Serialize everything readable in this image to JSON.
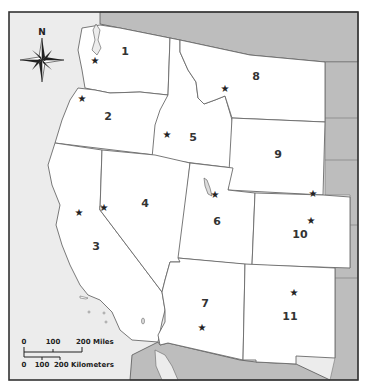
{
  "map": {
    "title": "",
    "colors": {
      "land": "#ffffff",
      "ocean": "#ececec",
      "outside_region": "#bdbdbd",
      "border": "#444444",
      "state_line": "#6a6a6a"
    },
    "compass": {
      "label": "N"
    },
    "states": [
      {
        "id": 1,
        "label": "1",
        "label_pos": [
          125,
          55
        ],
        "capital_star": [
          95,
          60
        ]
      },
      {
        "id": 2,
        "label": "2",
        "label_pos": [
          108,
          120
        ],
        "capital_star": [
          82,
          98
        ]
      },
      {
        "id": 3,
        "label": "3",
        "label_pos": [
          96,
          250
        ],
        "capital_star": [
          79,
          212
        ]
      },
      {
        "id": 4,
        "label": "4",
        "label_pos": [
          145,
          207
        ],
        "capital_star": [
          104,
          207
        ]
      },
      {
        "id": 5,
        "label": "5",
        "label_pos": [
          193,
          141
        ],
        "capital_star": [
          167,
          134
        ]
      },
      {
        "id": 6,
        "label": "6",
        "label_pos": [
          217,
          225
        ],
        "capital_star": [
          215,
          194
        ]
      },
      {
        "id": 7,
        "label": "7",
        "label_pos": [
          205,
          307
        ],
        "capital_star": [
          202,
          327
        ]
      },
      {
        "id": 8,
        "label": "8",
        "label_pos": [
          256,
          80
        ],
        "capital_star": [
          225,
          88
        ]
      },
      {
        "id": 9,
        "label": "9",
        "label_pos": [
          278,
          158
        ],
        "capital_star": [
          313,
          193
        ]
      },
      {
        "id": 10,
        "label": "10",
        "label_pos": [
          300,
          238
        ],
        "capital_star": [
          311,
          220
        ]
      },
      {
        "id": 11,
        "label": "11",
        "label_pos": [
          290,
          320
        ],
        "capital_star": [
          294,
          292
        ]
      }
    ],
    "scale_bar": {
      "miles_ticks": [
        "0",
        "100",
        "200 Miles"
      ],
      "km_ticks": [
        "0",
        "100",
        "200 Kilometers"
      ]
    }
  }
}
